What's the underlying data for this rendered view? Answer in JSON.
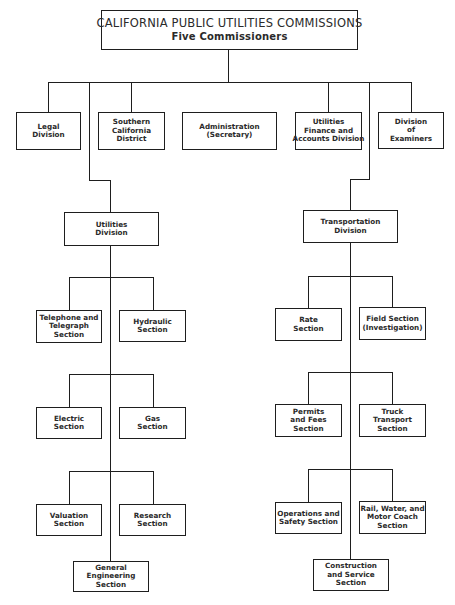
{
  "title": {
    "line1": "CALIFORNIA PUBLIC UTILITIES COMMISSIONS",
    "line2": "Five Commissioners"
  },
  "divisions": [
    {
      "lines": [
        "Legal",
        "Division"
      ]
    },
    {
      "lines": [
        "Southern",
        "California",
        "District"
      ]
    },
    {
      "lines": [
        "Administration",
        "(Secretary)"
      ]
    },
    {
      "lines": [
        "Utilities",
        "Finance and",
        "Accounts Division"
      ]
    },
    {
      "lines": [
        "Division",
        "of",
        "Examiners"
      ]
    }
  ],
  "utilities": {
    "division": {
      "lines": [
        "Utilities",
        "Division"
      ]
    },
    "sections": [
      {
        "lines": [
          "Telephone and",
          "Telegraph",
          "Section"
        ]
      },
      {
        "lines": [
          "Hydraulic",
          "Section"
        ]
      },
      {
        "lines": [
          "Electric",
          "Section"
        ]
      },
      {
        "lines": [
          "Gas",
          "Section"
        ]
      },
      {
        "lines": [
          "Valuation",
          "Section"
        ]
      },
      {
        "lines": [
          "Research",
          "Section"
        ]
      },
      {
        "lines": [
          "General",
          "Engineering",
          "Section"
        ]
      }
    ]
  },
  "transportation": {
    "division": {
      "lines": [
        "Transportation",
        "Division"
      ]
    },
    "sections": [
      {
        "lines": [
          "Rate",
          "Section"
        ]
      },
      {
        "lines": [
          "Field Section",
          "(Investigation)"
        ]
      },
      {
        "lines": [
          "Permits",
          "and Fees",
          "Section"
        ]
      },
      {
        "lines": [
          "Truck",
          "Transport",
          "Section"
        ]
      },
      {
        "lines": [
          "Operations and",
          "Safety Section"
        ]
      },
      {
        "lines": [
          "Rail, Water, and",
          "Motor Coach",
          "Section"
        ]
      },
      {
        "lines": [
          "Construction",
          "and Service",
          "Section"
        ]
      }
    ]
  },
  "colors": {
    "line": "#1e1e1e",
    "background": "#ffffff",
    "text": "#2a2a2a"
  }
}
